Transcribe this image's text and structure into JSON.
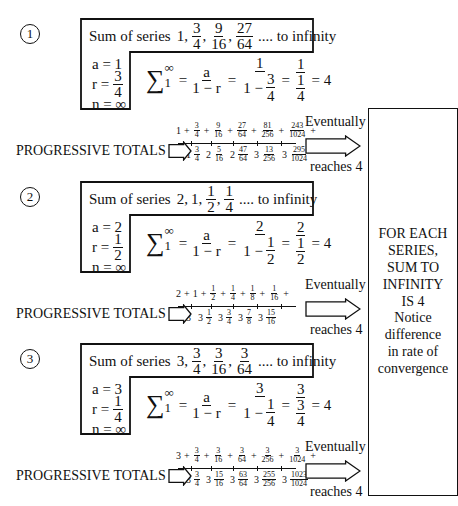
{
  "series": [
    {
      "number": "1",
      "title_prefix": "Sum of series",
      "title_terms": [
        {
          "whole": "1,"
        },
        {
          "num": "3",
          "den": "4",
          "sep": ","
        },
        {
          "num": "9",
          "den": "16",
          "sep": ","
        },
        {
          "num": "27",
          "den": "64",
          "sep": ""
        }
      ],
      "title_suffix": ".... to infinity",
      "a": "a = 1",
      "r_label": "r =",
      "r_num": "3",
      "r_den": "4",
      "n": "n = ∞",
      "formula": {
        "sigma": "∑",
        "upper": "∞",
        "lower": "1",
        "eq1": "=",
        "gen_num": "a",
        "gen_den": "1 − r",
        "eq2": "=",
        "sub_num": "1",
        "sub_den_prefix": "1 −",
        "sub_den_num": "3",
        "sub_den_den": "4",
        "eq3": "=",
        "simp_num": "1",
        "simp_den_num": "1",
        "simp_den_den": "4",
        "result": "= 4"
      },
      "terms": [
        {
          "whole": "1",
          "op": "+"
        },
        {
          "num": "3",
          "den": "4",
          "op": "+"
        },
        {
          "num": "9",
          "den": "16",
          "op": "+"
        },
        {
          "num": "27",
          "den": "64",
          "op": "+"
        },
        {
          "num": "81",
          "den": "256",
          "op": "+"
        },
        {
          "num": "243",
          "den": "1024",
          "op": "+"
        }
      ],
      "totals": [
        {
          "whole": "1",
          "num": "3",
          "den": "4"
        },
        {
          "whole": "2",
          "num": "5",
          "den": "16"
        },
        {
          "whole": "2",
          "num": "47",
          "den": "64"
        },
        {
          "whole": "3",
          "num": "13",
          "den": "256"
        },
        {
          "whole": "3",
          "num": "295",
          "den": "1024"
        }
      ]
    },
    {
      "number": "2",
      "title_prefix": "Sum of series",
      "title_terms": [
        {
          "whole": "2,"
        },
        {
          "whole": "1,"
        },
        {
          "num": "1",
          "den": "2",
          "sep": ","
        },
        {
          "num": "1",
          "den": "4",
          "sep": ""
        }
      ],
      "title_suffix": ".... to infinity",
      "a": "a = 2",
      "r_label": "r =",
      "r_num": "1",
      "r_den": "2",
      "n": "n = ∞",
      "formula": {
        "sigma": "∑",
        "upper": "∞",
        "lower": "1",
        "eq1": "=",
        "gen_num": "a",
        "gen_den": "1 − r",
        "eq2": "=",
        "sub_num": "2",
        "sub_den_prefix": "1 −",
        "sub_den_num": "1",
        "sub_den_den": "2",
        "eq3": "=",
        "simp_num": "2",
        "simp_den_num": "1",
        "simp_den_den": "2",
        "result": "= 4"
      },
      "terms": [
        {
          "whole": "2",
          "op": "+"
        },
        {
          "whole": "1",
          "op": "+"
        },
        {
          "num": "1",
          "den": "2",
          "op": "+"
        },
        {
          "num": "1",
          "den": "4",
          "op": "+"
        },
        {
          "num": "1",
          "den": "8",
          "op": "+"
        },
        {
          "num": "1",
          "den": "16",
          "op": "+"
        }
      ],
      "totals": [
        {
          "whole": "3"
        },
        {
          "whole": "3",
          "num": "1",
          "den": "2"
        },
        {
          "whole": "3",
          "num": "3",
          "den": "4"
        },
        {
          "whole": "3",
          "num": "7",
          "den": "8"
        },
        {
          "whole": "3",
          "num": "15",
          "den": "16"
        }
      ]
    },
    {
      "number": "3",
      "title_prefix": "Sum of series",
      "title_terms": [
        {
          "whole": "3,"
        },
        {
          "num": "3",
          "den": "4",
          "sep": ","
        },
        {
          "num": "3",
          "den": "16",
          "sep": ","
        },
        {
          "num": "3",
          "den": "64",
          "sep": ""
        }
      ],
      "title_suffix": ".... to infinity",
      "a": "a = 3",
      "r_label": "r =",
      "r_num": "1",
      "r_den": "4",
      "n": "n = ∞",
      "formula": {
        "sigma": "∑",
        "upper": "∞",
        "lower": "1",
        "eq1": "=",
        "gen_num": "a",
        "gen_den": "1 − r",
        "eq2": "=",
        "sub_num": "3",
        "sub_den_prefix": "1 −",
        "sub_den_num": "1",
        "sub_den_den": "4",
        "eq3": "=",
        "simp_num": "3",
        "simp_den_num": "3",
        "simp_den_den": "4",
        "result": "= 4"
      },
      "terms": [
        {
          "whole": "3",
          "op": "+"
        },
        {
          "num": "3",
          "den": "4",
          "op": "+"
        },
        {
          "num": "3",
          "den": "16",
          "op": "+"
        },
        {
          "num": "3",
          "den": "64",
          "op": "+"
        },
        {
          "num": "3",
          "den": "256",
          "op": "+"
        },
        {
          "num": "3",
          "den": "1024",
          "op": "+"
        }
      ],
      "totals": [
        {
          "whole": "3",
          "num": "3",
          "den": "4"
        },
        {
          "whole": "3",
          "num": "15",
          "den": "16"
        },
        {
          "whole": "3",
          "num": "63",
          "den": "64"
        },
        {
          "whole": "3",
          "num": "255",
          "den": "256"
        },
        {
          "whole": "3",
          "num": "1023",
          "den": "1024"
        }
      ]
    }
  ],
  "progressive_totals_label": "PROGRESSIVE TOTALS",
  "eventually_label": "Eventually",
  "reaches_label": "reaches 4",
  "side_box": {
    "lines_bold": [
      "FOR EACH",
      "SERIES,",
      "SUM TO",
      "INFINITY",
      "IS 4"
    ],
    "lines": [
      "Notice",
      "difference",
      "in rate of",
      "convergence"
    ]
  }
}
